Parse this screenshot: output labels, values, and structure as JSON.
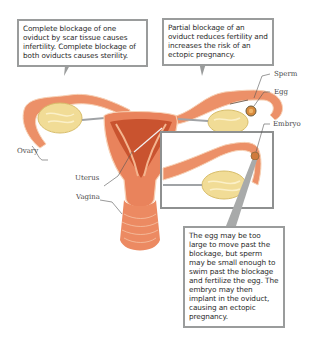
{
  "callouts": {
    "complete_blockage": "Complete blockage of one oviduct by scar tissue causes infertility. Complete blockage of both oviducts causes sterility.",
    "partial_blockage": "Partial blockage of an oviduct reduces fertility and increases the risk of an ectopic pregnancy.",
    "ectopic": "The egg may be too large to move past the blockage, but sperm may be small enough to swim past the blockage and fertilize the egg. The embryo may then implant in the oviduct, causing an ectopic pregnancy."
  },
  "labels": {
    "ovary": "Ovary",
    "uterus": "Uterus",
    "vagina": "Vagina",
    "sperm": "Sperm",
    "egg": "Egg",
    "embryo": "Embryo"
  },
  "colors": {
    "tissue": "#e9835c",
    "tissue_dark": "#c9532f",
    "tissue_light": "#f4b58f",
    "ovary": "#f1dc96",
    "callout_border": "#9a9c9c",
    "inset_border": "#8e9090"
  }
}
